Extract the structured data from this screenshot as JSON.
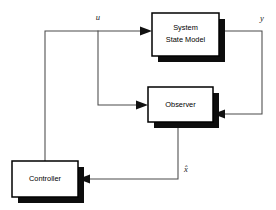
{
  "diagram": {
    "type": "block-diagram",
    "blocks": [
      {
        "id": "system-state-model",
        "label_line1": "System",
        "label_line2": "State Model",
        "x": 152,
        "y": 13,
        "width": 67,
        "height": 43
      },
      {
        "id": "observer",
        "label_line1": "Observer",
        "label_line2": "",
        "x": 148,
        "y": 87,
        "width": 65,
        "height": 35
      },
      {
        "id": "controller",
        "label_line1": "Controller",
        "label_line2": "",
        "x": 12,
        "y": 161,
        "width": 66,
        "height": 36
      }
    ],
    "signals": [
      {
        "id": "u",
        "label": "u",
        "x": 98,
        "y": 20
      },
      {
        "id": "y",
        "label": "y",
        "x": 262,
        "y": 21
      },
      {
        "id": "x-hat",
        "label": "x̂",
        "x": 186,
        "y": 172
      }
    ],
    "colors": {
      "wire": "#4a4a4a",
      "box_outline": "#000000",
      "box_fill": "#ffffff",
      "box_shadow": "#0d0d0d",
      "background": "#ffffff",
      "text": "#000000"
    }
  }
}
